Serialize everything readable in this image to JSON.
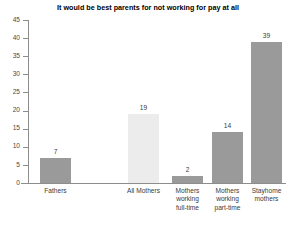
{
  "chart_data": {
    "type": "bar",
    "title": "It would be best parents for not working for pay at all",
    "xlabel": "",
    "ylabel": "",
    "ylim": [
      0,
      45
    ],
    "ytick_step": 5,
    "yticks": [
      0,
      5,
      10,
      15,
      20,
      25,
      30,
      35,
      40,
      45
    ],
    "grid": false,
    "legend": false,
    "categories": [
      "Fathers",
      "All Mothers",
      "Mothers\nworking\nfull-time",
      "Mothers\nworking\npart-time",
      "Stayhome\nmothers"
    ],
    "values": [
      7,
      19,
      2,
      14,
      39
    ],
    "value_labels": [
      "7",
      "19",
      "2",
      "14",
      "39"
    ],
    "bar_colors": [
      "#9a9a9a",
      "#ececec",
      "#9a9a9a",
      "#9a9a9a",
      "#9a9a9a"
    ],
    "axis_color": "#8d8d8d",
    "text_color": "#3a3a3a",
    "background": "#ffffff"
  }
}
